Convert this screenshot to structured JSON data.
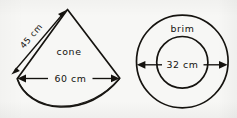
{
  "figure": {
    "background_color": "#f7f7f5",
    "ink_color": "#14120e",
    "shapes": [
      {
        "id": "cone-net",
        "kind": "circular-sector",
        "label": "cone",
        "dimension_labels": [
          "45 cm",
          "60 cm"
        ]
      },
      {
        "id": "brim",
        "kind": "annulus",
        "label": "brim",
        "dimension_labels": [
          "32 cm"
        ]
      }
    ]
  },
  "cone": {
    "shape_label": "cone",
    "slant_label": "45 cm",
    "width_label": "60 cm"
  },
  "brim": {
    "shape_label": "brim",
    "diameter_label": "32 cm"
  }
}
